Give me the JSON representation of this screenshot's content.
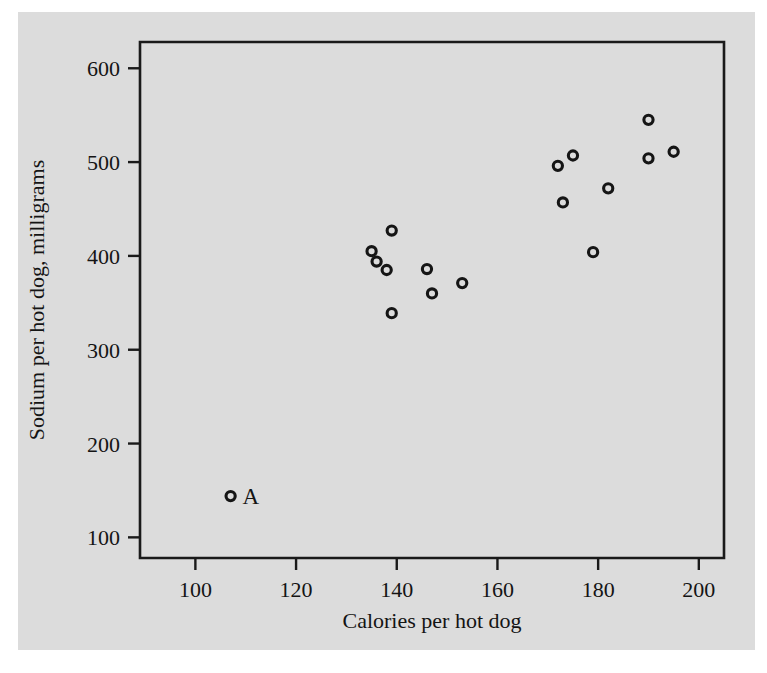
{
  "figure": {
    "background_color": "#dcdcdc",
    "page_color": "#ffffff",
    "ink_color": "#141414"
  },
  "chart_data": {
    "type": "scatter",
    "title": "",
    "xlabel": "Calories per hot dog",
    "ylabel": "Sodium per hot dog, milligrams",
    "xlim": [
      89,
      205
    ],
    "ylim": [
      78,
      628
    ],
    "xticks": [
      100,
      120,
      140,
      160,
      180,
      200
    ],
    "xtick_labels": [
      "100",
      "120",
      "140",
      "160",
      "180",
      "200"
    ],
    "yticks": [
      100,
      200,
      300,
      400,
      500,
      600
    ],
    "ytick_labels": [
      "100",
      "200",
      "300",
      "400",
      "500",
      "600"
    ],
    "grid": false,
    "legend": false,
    "marker": "open-circle",
    "points": [
      {
        "x": 107,
        "y": 144,
        "label": "A"
      },
      {
        "x": 135,
        "y": 405,
        "label": ""
      },
      {
        "x": 136,
        "y": 394,
        "label": ""
      },
      {
        "x": 138,
        "y": 385,
        "label": ""
      },
      {
        "x": 139,
        "y": 427,
        "label": ""
      },
      {
        "x": 139,
        "y": 339,
        "label": ""
      },
      {
        "x": 146,
        "y": 386,
        "label": ""
      },
      {
        "x": 147,
        "y": 360,
        "label": ""
      },
      {
        "x": 153,
        "y": 371,
        "label": ""
      },
      {
        "x": 172,
        "y": 496,
        "label": ""
      },
      {
        "x": 173,
        "y": 457,
        "label": ""
      },
      {
        "x": 175,
        "y": 507,
        "label": ""
      },
      {
        "x": 179,
        "y": 404,
        "label": ""
      },
      {
        "x": 182,
        "y": 472,
        "label": ""
      },
      {
        "x": 190,
        "y": 545,
        "label": ""
      },
      {
        "x": 190,
        "y": 504,
        "label": ""
      },
      {
        "x": 195,
        "y": 511,
        "label": ""
      }
    ]
  }
}
